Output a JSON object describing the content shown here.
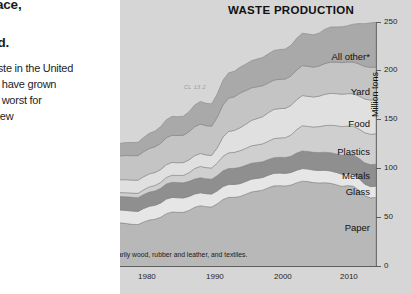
{
  "article": {
    "heading_fragments": [
      "ace,",
      "id."
    ],
    "body_lines": [
      "aste in the United",
      "ts have grown",
      "e worst for",
      "new"
    ]
  },
  "chart": {
    "title": "WASTE PRODUCTION",
    "figure_code": "CL 13.2",
    "footnote": "* \"All Other\" includes primarily wood, rubber and leather, and textiles.",
    "y_axis_title": "Million tons",
    "panel_color": "#d6d6d6"
  },
  "chart_data": {
    "type": "area",
    "title": "WASTE PRODUCTION",
    "xlabel": "",
    "ylabel": "Million tons",
    "xlim": [
      1960,
      2010
    ],
    "ylim": [
      0,
      250
    ],
    "yticks": [
      0,
      50,
      100,
      150,
      200,
      250
    ],
    "xticks": [
      1960,
      1970,
      1980,
      1990,
      2000,
      2010
    ],
    "grid": false,
    "legend": "inline-band-labels",
    "stacked": true,
    "x": [
      1960,
      1965,
      1970,
      1975,
      1980,
      1985,
      1990,
      1995,
      2000,
      2005,
      2010
    ],
    "series": [
      {
        "name": "Paper",
        "color": "#b8b8b8",
        "values": [
          30,
          38,
          45,
          44,
          55,
          62,
          73,
          82,
          87,
          84,
          71
        ]
      },
      {
        "name": "Glass",
        "color": "#e6e6e6",
        "values": [
          6.7,
          8.7,
          12.7,
          13.5,
          15,
          13.2,
          13.1,
          12.8,
          12.8,
          12.5,
          11.5
        ]
      },
      {
        "name": "Metals",
        "color": "#8f8f8f",
        "values": [
          10.8,
          12.6,
          13.8,
          14.1,
          15.5,
          15.3,
          16.6,
          15.8,
          18.0,
          19.0,
          22.4
        ]
      },
      {
        "name": "Plastics",
        "color": "#cfcfcf",
        "values": [
          0.4,
          1.4,
          3.0,
          4.5,
          6.8,
          11.5,
          17.1,
          18.9,
          25.5,
          29.0,
          31.0
        ]
      },
      {
        "name": "Food",
        "color": "#e0e0e0",
        "values": [
          12.2,
          12.7,
          12.8,
          13.4,
          13.0,
          13.2,
          23.9,
          29.8,
          30.7,
          32.9,
          34.8
        ]
      },
      {
        "name": "Yard",
        "color": "#c4c4c4",
        "values": [
          20.0,
          21.6,
          23.2,
          25.2,
          27.5,
          30.0,
          35.0,
          29.8,
          30.5,
          32.1,
          33.4
        ]
      },
      {
        "name": "All other*",
        "color": "#a9a9a9",
        "values": [
          8.3,
          10.1,
          11.6,
          13.8,
          18.8,
          22.9,
          26.6,
          30.0,
          33.0,
          36.5,
          45.9
        ]
      }
    ],
    "totals": [
      88.4,
      105.1,
      122.1,
      128.5,
      151.6,
      168.1,
      205.3,
      219.1,
      237.5,
      246.0,
      250.0
    ]
  },
  "x_tick_labels": [
    "1960",
    "1970",
    "1980",
    "1990",
    "2000",
    "2010"
  ],
  "y_tick_labels": [
    "0",
    "50",
    "100",
    "150",
    "200",
    "250"
  ],
  "series_labels": [
    "All other*",
    "Yard",
    "Food",
    "Plastics",
    "Metals",
    "Glass",
    "Paper"
  ]
}
